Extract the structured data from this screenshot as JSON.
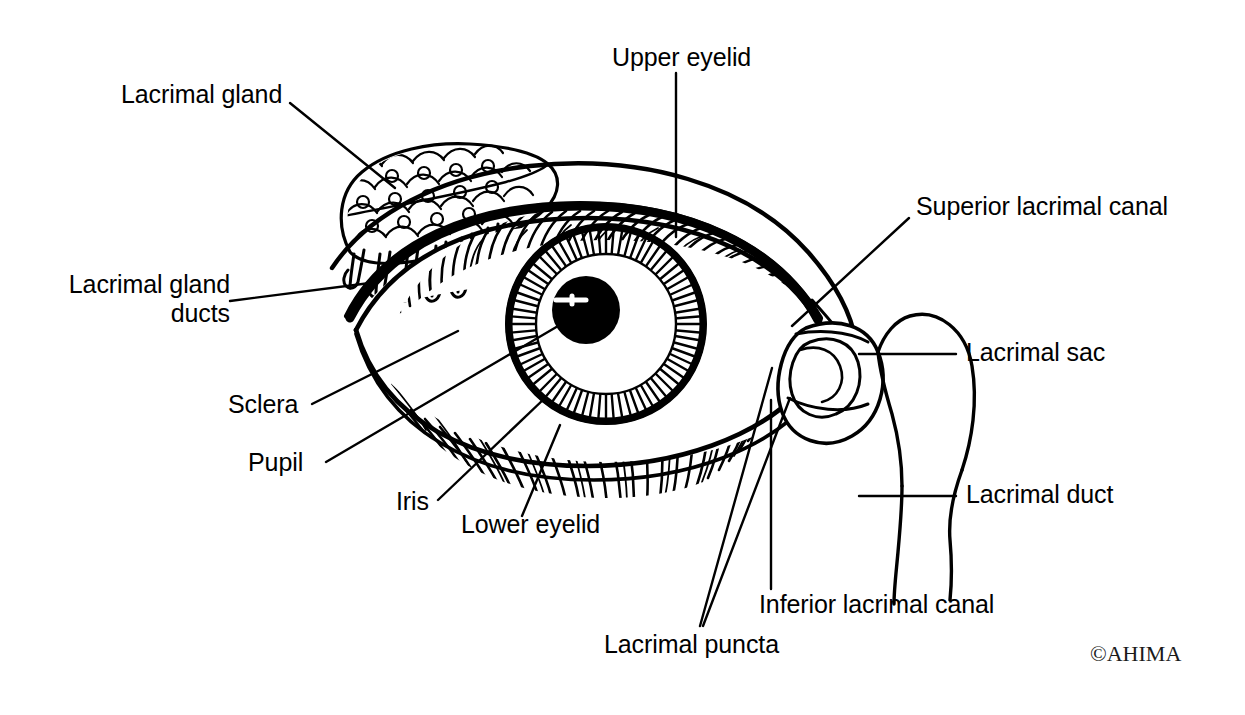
{
  "figure": {
    "background_color": "#ffffff",
    "ink_color": "#000000",
    "width": 1245,
    "height": 715
  },
  "labels": {
    "lacrimal_gland": "Lacrimal gland",
    "lacrimal_gland_ducts_line1": "Lacrimal gland",
    "lacrimal_gland_ducts_line2": "ducts",
    "upper_eyelid": "Upper eyelid",
    "superior_lacrimal_canal": "Superior lacrimal canal",
    "lacrimal_sac": "Lacrimal sac",
    "lacrimal_duct": "Lacrimal duct",
    "sclera": "Sclera",
    "pupil": "Pupil",
    "iris": "Iris",
    "lower_eyelid": "Lower eyelid",
    "lacrimal_puncta": "Lacrimal puncta",
    "inferior_lacrimal_canal": "Inferior lacrimal canal"
  },
  "credit": {
    "copyright": "©AHIMA"
  },
  "structures": [
    {
      "name": "lacrimal-gland",
      "label": "Lacrimal gland"
    },
    {
      "name": "lacrimal-gland-ducts",
      "label": "Lacrimal gland ducts"
    },
    {
      "name": "upper-eyelid",
      "label": "Upper eyelid"
    },
    {
      "name": "lower-eyelid",
      "label": "Lower eyelid"
    },
    {
      "name": "sclera",
      "label": "Sclera"
    },
    {
      "name": "iris",
      "label": "Iris"
    },
    {
      "name": "pupil",
      "label": "Pupil"
    },
    {
      "name": "lacrimal-puncta",
      "label": "Lacrimal puncta"
    },
    {
      "name": "superior-lacrimal-canal",
      "label": "Superior lacrimal canal"
    },
    {
      "name": "inferior-lacrimal-canal",
      "label": "Inferior lacrimal canal"
    },
    {
      "name": "lacrimal-sac",
      "label": "Lacrimal sac"
    },
    {
      "name": "lacrimal-duct",
      "label": "Lacrimal duct"
    }
  ]
}
